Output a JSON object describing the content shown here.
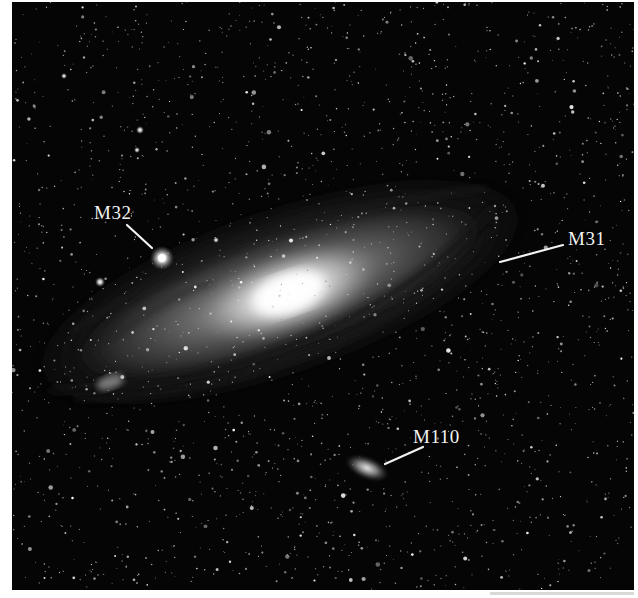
{
  "image": {
    "subject": "Andromeda galaxy with companion galaxies",
    "background_color": "#050505",
    "label_color": "#f2f2f2"
  },
  "labels": [
    {
      "id": "m32",
      "text": "M32",
      "x": 82,
      "y": 201,
      "line": [
        115,
        223,
        140,
        246
      ],
      "target": [
        150,
        256
      ]
    },
    {
      "id": "m31",
      "text": "M31",
      "x": 556,
      "y": 227,
      "line": [
        488,
        260,
        551,
        243
      ],
      "target": [
        270,
        290
      ]
    },
    {
      "id": "m110",
      "text": "M110",
      "x": 401,
      "y": 425,
      "line": [
        373,
        462,
        411,
        445
      ],
      "target": [
        355,
        466
      ]
    }
  ]
}
